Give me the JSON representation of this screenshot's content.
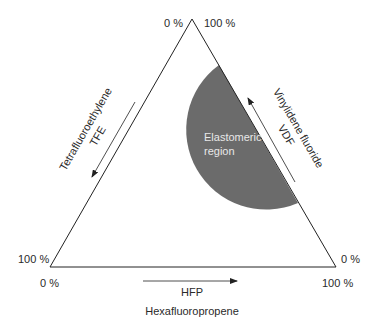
{
  "diagram": {
    "type": "ternary",
    "colors": {
      "background": "#ffffff",
      "lines": "#222222",
      "region_fill": "#6b6b6b",
      "text": "#2a2a2a",
      "region_text": "#e8e8e8"
    },
    "corners": {
      "top": {
        "left_label": "0 %",
        "right_label": "100 %"
      },
      "bottom_left": {
        "side_label": "100 %",
        "below_label": "0 %"
      },
      "bottom_right": {
        "side_label": "0 %",
        "below_label": "100 %"
      }
    },
    "axes": {
      "left": {
        "name": "Tetrafluoroethylene",
        "abbr": "TFE",
        "arrow_direction": "down-left"
      },
      "right": {
        "name": "Vinylidene fluoride",
        "abbr": "VDF",
        "arrow_direction": "up-left"
      },
      "bottom": {
        "name": "Hexafluoropropene",
        "abbr": "HFP",
        "arrow_direction": "right"
      }
    },
    "region": {
      "line1": "Elastomeric",
      "line2": "region"
    }
  }
}
